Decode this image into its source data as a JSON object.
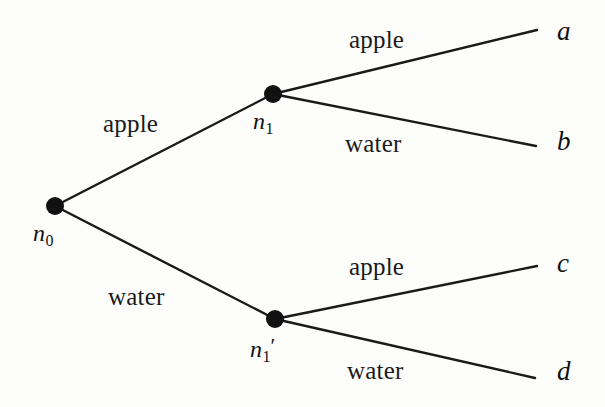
{
  "figure": {
    "type": "decision-tree-diagram",
    "background_color": "#fdfdfc",
    "line_color": "#1a1a1a",
    "node_color": "#111111"
  },
  "nodes": [
    {
      "id": "n0",
      "label": "n",
      "subscript": "0",
      "prime": "",
      "x": 55,
      "y": 206,
      "radius": 9,
      "label_x": 33,
      "label_y": 220
    },
    {
      "id": "n1",
      "label": "n",
      "subscript": "1",
      "prime": "",
      "x": 273,
      "y": 94,
      "radius": 9,
      "label_x": 253,
      "label_y": 108
    },
    {
      "id": "n1p",
      "label": "n",
      "subscript": "1",
      "prime": "′",
      "x": 275,
      "y": 319,
      "radius": 9,
      "label_x": 250,
      "label_y": 333
    }
  ],
  "leaves": [
    {
      "id": "a",
      "label": "a",
      "x": 557,
      "y": 16,
      "end_x": 537,
      "end_y": 30
    },
    {
      "id": "b",
      "label": "b",
      "x": 557,
      "y": 126,
      "end_x": 536,
      "end_y": 146
    },
    {
      "id": "c",
      "label": "c",
      "x": 557,
      "y": 248,
      "end_x": 537,
      "end_y": 266
    },
    {
      "id": "d",
      "label": "d",
      "x": 557,
      "y": 356,
      "end_x": 535,
      "end_y": 378
    }
  ],
  "edges": [
    {
      "id": "n0-n1",
      "from": "n0",
      "to": "n1",
      "label": "apple",
      "label_x": 103,
      "label_y": 110
    },
    {
      "id": "n0-n1p",
      "from": "n0",
      "to": "n1p",
      "label": "water",
      "label_x": 108,
      "label_y": 283
    },
    {
      "id": "n1-a",
      "from": "n1",
      "to": "a",
      "label": "apple",
      "label_x": 349,
      "label_y": 26
    },
    {
      "id": "n1-b",
      "from": "n1",
      "to": "b",
      "label": "water",
      "label_x": 345,
      "label_y": 130
    },
    {
      "id": "n1p-c",
      "from": "n1p",
      "to": "c",
      "label": "apple",
      "label_x": 349,
      "label_y": 253
    },
    {
      "id": "n1p-d",
      "from": "n1p",
      "to": "d",
      "label": "water",
      "label_x": 347,
      "label_y": 357
    }
  ]
}
